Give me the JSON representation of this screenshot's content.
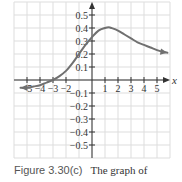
{
  "chart_data": {
    "type": "line",
    "title": "",
    "xlabel": "x",
    "ylabel": "",
    "xlim": [
      -6,
      6
    ],
    "ylim": [
      -0.6,
      0.6
    ],
    "grid": true,
    "x_ticks": [
      -5,
      -4,
      -3,
      -2,
      1,
      2,
      3,
      4,
      5
    ],
    "x_tick_labels": [
      "−5",
      "−4",
      "−3",
      "−2",
      "1",
      "2",
      "3",
      "4",
      "5"
    ],
    "y_ticks": [
      0.5,
      0.4,
      0.3,
      0.2,
      0.1,
      -0.1,
      -0.2,
      -0.3,
      -0.4,
      -0.5
    ],
    "y_tick_labels": [
      "0.5",
      "0.4",
      "0.3",
      "0.2",
      "0.1",
      "−0.1",
      "−0.2",
      "−0.3",
      "−0.4",
      "−0.5"
    ],
    "series": [
      {
        "name": "f(x)",
        "color": "#707070",
        "arrows": "both",
        "x": [
          -5.5,
          -5,
          -4.5,
          -4,
          -3.5,
          -3,
          -2.5,
          -2,
          -1.5,
          -1,
          -0.5,
          0,
          0.5,
          1,
          1.3,
          1.5,
          2,
          2.5,
          3,
          3.5,
          4,
          4.5,
          5,
          5.5,
          5.8
        ],
        "y": [
          -0.06,
          -0.06,
          -0.05,
          -0.04,
          -0.02,
          0.0,
          0.03,
          0.07,
          0.13,
          0.2,
          0.27,
          0.33,
          0.38,
          0.4,
          0.405,
          0.4,
          0.38,
          0.35,
          0.32,
          0.29,
          0.27,
          0.25,
          0.23,
          0.215,
          0.21
        ]
      }
    ]
  },
  "caption": {
    "figure_label": "Figure  3.30(c)",
    "text": "The graph of"
  },
  "colors": {
    "grid": "#dddddd",
    "axis": "#333333",
    "curve": "#707070"
  }
}
